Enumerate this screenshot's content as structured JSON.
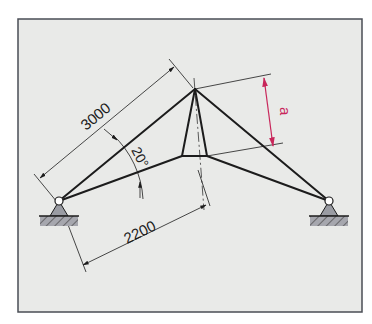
{
  "diagram": {
    "type": "truss-structure-drawing",
    "dimensions": {
      "rafter_length": "3000",
      "horizontal_offset": "2200",
      "angle": "20°",
      "unknown_height": "a"
    },
    "supports": [
      {
        "name": "left-pin-support",
        "type": "pinned"
      },
      {
        "name": "right-pin-support",
        "type": "pinned"
      }
    ],
    "colors": {
      "background": "#e9eae8",
      "frame": "#4a4d55",
      "lines": "#1c1c1c",
      "dimension_highlight": "#c8265a",
      "support_fill": "#9a9ca3"
    }
  }
}
